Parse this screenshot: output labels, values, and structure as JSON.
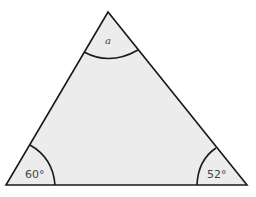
{
  "diagram": {
    "shape": "triangle",
    "fill_color": "#ececec",
    "stroke_color": "#1a1a1a",
    "vertices": {
      "top": {
        "x": 108,
        "y": 12
      },
      "bottom_left": {
        "x": 6,
        "y": 185
      },
      "bottom_right": {
        "x": 247,
        "y": 185
      }
    },
    "angles": {
      "top": {
        "label": "a",
        "type": "unknown"
      },
      "bottom_left": {
        "label": "60°",
        "value": 60
      },
      "bottom_right": {
        "label": "52°",
        "value": 52
      }
    }
  }
}
